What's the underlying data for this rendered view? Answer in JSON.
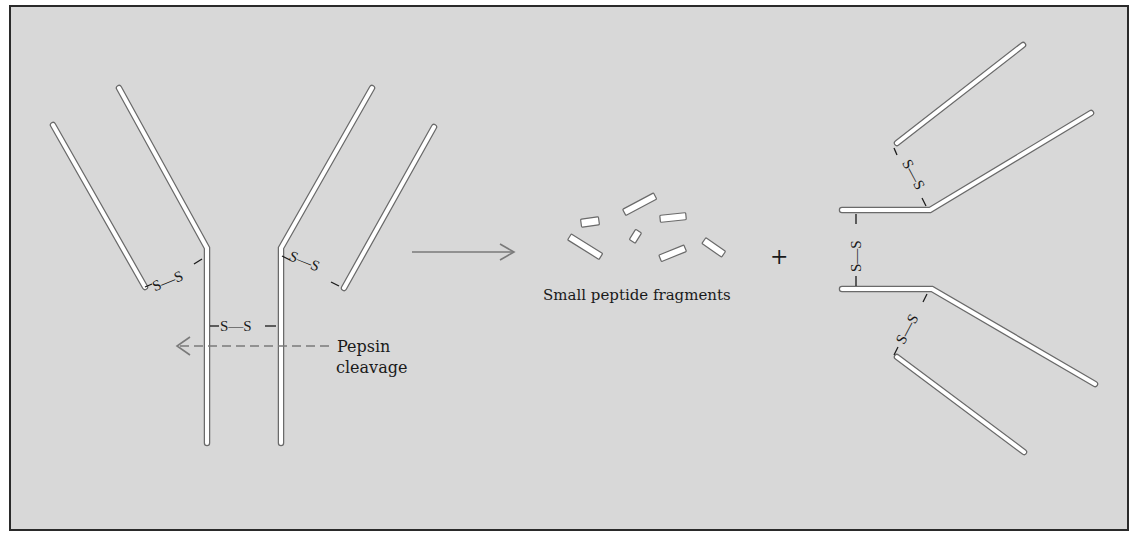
{
  "diagram": {
    "labels": {
      "pepsin": "Pepsin",
      "cleavage": "cleavage",
      "fragments": "Small peptide fragments",
      "plus": "+",
      "disulfide": "S—S"
    },
    "colors": {
      "background": "#d8d8d8",
      "chain_fill": "#ffffff",
      "chain_stroke": "#6a6a6a",
      "arrow": "#7a7a7a",
      "text": "#1a1a1a"
    },
    "panels": [
      {
        "name": "intact antibody",
        "description": "Y-shaped antibody with heavy/light chains linked by disulfide bonds"
      },
      {
        "name": "products",
        "description": "Small peptide fragments + F(ab')2 fragment"
      }
    ]
  }
}
